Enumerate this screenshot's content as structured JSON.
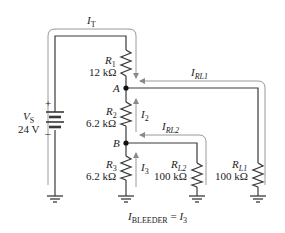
{
  "source": {
    "name": "V",
    "sub": "S",
    "value": "24 V",
    "plus": "+",
    "minus": "–"
  },
  "resistors": [
    {
      "name": "R",
      "sub": "1",
      "value": "12 kΩ"
    },
    {
      "name": "R",
      "sub": "2",
      "value": "6.2 kΩ"
    },
    {
      "name": "R",
      "sub": "3",
      "value": "6.2 kΩ"
    },
    {
      "name": "R",
      "sub": "L2",
      "value": "100 kΩ"
    },
    {
      "name": "R",
      "sub": "L1",
      "value": "100 kΩ"
    }
  ],
  "nodes": {
    "a": "A",
    "b": "B"
  },
  "currents": {
    "total": {
      "name": "I",
      "sub": "T"
    },
    "i2": {
      "name": "I",
      "sub": "2"
    },
    "i3": {
      "name": "I",
      "sub": "3"
    },
    "irl1": {
      "name": "I",
      "sub": "RL1"
    },
    "irl2": {
      "name": "I",
      "sub": "RL2"
    }
  },
  "caption": {
    "lhs_name": "I",
    "lhs_sub": "BLEEDER",
    "eq": " = ",
    "rhs_name": "I",
    "rhs_sub": "3"
  },
  "colors": {
    "wire": "#3a3a3a",
    "current_path": "#9a9a9a"
  }
}
